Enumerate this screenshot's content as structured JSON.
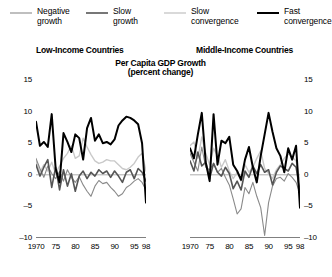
{
  "legend": {
    "items": [
      {
        "label": "Negative\ngrowth",
        "name": "legend-item-negative-growth",
        "color": "#8a8a8a",
        "width": 1.1
      },
      {
        "label": "Slow\ngrowth",
        "name": "legend-item-slow-growth",
        "color": "#555555",
        "width": 1.6
      },
      {
        "label": "Slow\nconvergence",
        "name": "legend-item-slow-convergence",
        "color": "#c9c9c9",
        "width": 1.4
      },
      {
        "label": "Fast\nconvergence",
        "name": "legend-item-fast-convergence",
        "color": "#000000",
        "width": 2.0
      }
    ]
  },
  "titles": {
    "panel_left": "Low-Income Countries",
    "panel_right": "Middle-Income Countries",
    "main": "Per Capita GDP Growth",
    "sub": "(percent change)"
  },
  "chart_data": {
    "type": "line",
    "title": "Per Capita GDP Growth",
    "subtitle": "(percent change)",
    "xlabel": "",
    "ylabel": "percent change",
    "ylim": [
      -10,
      15
    ],
    "yticks": [
      15,
      10,
      5,
      0,
      -5,
      -10
    ],
    "ytick_labels": [
      "15",
      "10",
      "5",
      "0",
      "-5",
      "-10"
    ],
    "xlim": [
      1970,
      1998
    ],
    "xticks": [
      1970,
      1975,
      1980,
      1985,
      1990,
      1995,
      1998
    ],
    "xtick_labels_left": [
      "1970",
      "75",
      "80",
      "85",
      "90",
      "95",
      "98"
    ],
    "xtick_labels_right": [
      "1970",
      "75",
      "80",
      "85",
      "90",
      "95",
      "98"
    ],
    "grid": false,
    "legend_position": "top",
    "zero_line": true,
    "x": [
      1970,
      1971,
      1972,
      1973,
      1974,
      1975,
      1976,
      1977,
      1978,
      1979,
      1980,
      1981,
      1982,
      1983,
      1984,
      1985,
      1986,
      1987,
      1988,
      1989,
      1990,
      1991,
      1992,
      1993,
      1994,
      1995,
      1996,
      1997,
      1998
    ],
    "panels": [
      {
        "name": "Low-Income Countries",
        "series": [
          {
            "name": "Negative growth",
            "color": "#8a8a8a",
            "values": [
              2.6,
              1.0,
              -0.4,
              1.4,
              0.2,
              -0.6,
              0.5,
              -1.0,
              0.8,
              -0.4,
              -1.2,
              -0.3,
              -1.6,
              -2.6,
              -3.4,
              -1.8,
              -0.9,
              -1.4,
              -1.2,
              -2.0,
              -2.6,
              -3.4,
              -3.0,
              -2.0,
              -1.6,
              -1.0,
              -0.6,
              -1.2,
              -2.4
            ]
          },
          {
            "name": "Slow growth",
            "color": "#555555",
            "values": [
              1.6,
              -0.2,
              1.2,
              2.4,
              -2.0,
              1.2,
              -2.4,
              0.8,
              -1.8,
              0.2,
              -2.6,
              -0.2,
              0.6,
              -0.6,
              0.4,
              -0.2,
              0.8,
              0.2,
              0.6,
              -0.4,
              0.6,
              -0.2,
              -1.2,
              0.4,
              0.8,
              -0.6,
              1.0,
              0.4,
              -1.0
            ]
          },
          {
            "name": "Slow convergence",
            "color": "#c9c9c9",
            "values": [
              2.2,
              0.4,
              1.6,
              0.6,
              2.0,
              0.2,
              1.4,
              2.6,
              3.4,
              4.6,
              2.6,
              3.0,
              5.8,
              4.4,
              3.2,
              2.2,
              1.8,
              2.0,
              2.4,
              2.2,
              2.2,
              1.6,
              1.0,
              0.8,
              1.2,
              1.8,
              2.8,
              3.4,
              0.6
            ]
          },
          {
            "name": "Fast convergence",
            "color": "#000000",
            "values": [
              8.4,
              4.6,
              5.2,
              4.4,
              9.6,
              1.0,
              -1.2,
              6.6,
              5.2,
              3.6,
              6.4,
              5.8,
              2.4,
              7.4,
              9.0,
              5.4,
              6.4,
              5.0,
              5.2,
              4.8,
              5.6,
              7.8,
              8.6,
              9.2,
              9.0,
              8.6,
              8.0,
              5.0,
              -4.4
            ]
          }
        ]
      },
      {
        "name": "Middle-Income Countries",
        "series": [
          {
            "name": "Negative growth",
            "color": "#8a8a8a",
            "values": [
              3.4,
              2.0,
              0.6,
              4.4,
              1.2,
              0.8,
              1.8,
              0.4,
              1.0,
              -0.4,
              -1.6,
              -3.8,
              -6.2,
              -5.4,
              -2.0,
              -3.0,
              -1.2,
              -3.4,
              -5.2,
              -9.6,
              -4.4,
              -1.8,
              -0.6,
              -0.4,
              -1.0,
              0.2,
              -0.4,
              -1.2,
              -3.0
            ]
          },
          {
            "name": "Slow growth",
            "color": "#555555",
            "values": [
              2.2,
              0.6,
              3.6,
              1.4,
              2.0,
              -0.6,
              1.8,
              0.4,
              -0.2,
              1.2,
              0.2,
              -2.2,
              -1.0,
              -2.4,
              0.6,
              -0.4,
              1.4,
              0.2,
              1.6,
              0.4,
              0.8,
              -1.6,
              0.4,
              1.4,
              1.0,
              0.6,
              1.8,
              1.2,
              -2.6
            ]
          },
          {
            "name": "Slow convergence",
            "color": "#c9c9c9",
            "values": [
              4.6,
              5.2,
              2.6,
              6.0,
              3.4,
              1.6,
              4.2,
              3.0,
              1.2,
              2.4,
              0.6,
              -0.6,
              0.4,
              -1.0,
              1.6,
              0.4,
              1.2,
              2.6,
              3.8,
              1.0,
              0.2,
              -0.6,
              0.8,
              1.6,
              2.6,
              3.4,
              2.8,
              2.2,
              -1.0
            ]
          },
          {
            "name": "Fast convergence",
            "color": "#000000",
            "values": [
              4.2,
              2.6,
              6.4,
              9.8,
              2.0,
              -1.0,
              9.6,
              1.6,
              5.4,
              5.0,
              6.0,
              1.6,
              0.6,
              -0.8,
              2.4,
              4.4,
              1.2,
              -1.2,
              3.0,
              6.4,
              9.8,
              6.8,
              4.2,
              3.0,
              0.4,
              4.2,
              2.4,
              4.6,
              -5.2
            ]
          }
        ]
      }
    ]
  }
}
